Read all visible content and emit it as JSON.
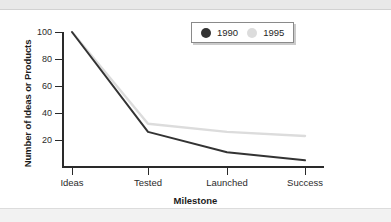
{
  "chart_data": {
    "type": "line",
    "title": "",
    "xlabel": "Milestone",
    "ylabel": "Number of Ideas or Products",
    "categories": [
      "Ideas",
      "Tested",
      "Launched",
      "Success"
    ],
    "series": [
      {
        "name": "1990",
        "color": "#333333",
        "values": [
          100,
          26,
          11,
          5
        ]
      },
      {
        "name": "1995",
        "color": "#dcdcdc",
        "values": [
          100,
          32,
          26,
          23
        ]
      }
    ],
    "ylim": [
      0,
      108
    ],
    "yticks": [
      20,
      40,
      60,
      80,
      100
    ],
    "ytick_labels": [
      "20",
      "40",
      "60",
      "80",
      "100"
    ],
    "grid": false,
    "legend_position": "top-right",
    "legend_entries": [
      {
        "label": "1990",
        "marker": "filled-circle",
        "color": "#333333"
      },
      {
        "label": "1995",
        "marker": "filled-circle",
        "color": "#dcdcdc"
      }
    ]
  },
  "colors": {
    "axis": "#2a2a2a",
    "text": "#1c1c1c",
    "page_band": "#e9e9e9",
    "background": "#ffffff"
  }
}
